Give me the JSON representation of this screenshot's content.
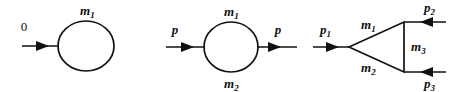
{
  "figure": {
    "name": "feynman-diagrams-one-loop",
    "background_color": "#ffffff",
    "ink_color": "#111111",
    "width": 457,
    "height": 92,
    "diagram_count": 3
  },
  "diagrams": [
    {
      "id": "tadpole",
      "name": "tadpole-diagram",
      "external_lines": [
        {
          "label": "0",
          "italic": false,
          "direction": "incoming",
          "position": "left"
        }
      ],
      "loop_labels": [
        {
          "label": "m",
          "subscript": "1",
          "position": "top"
        }
      ]
    },
    {
      "id": "self-energy",
      "name": "self-energy-bubble-diagram",
      "external_lines": [
        {
          "label": "p",
          "italic": true,
          "direction": "incoming",
          "position": "left"
        },
        {
          "label": "p",
          "italic": true,
          "direction": "outgoing",
          "position": "right"
        }
      ],
      "loop_labels": [
        {
          "label": "m",
          "subscript": "1",
          "position": "top"
        },
        {
          "label": "m",
          "subscript": "2",
          "position": "bottom"
        }
      ]
    },
    {
      "id": "triangle-vertex",
      "name": "triangle-vertex-diagram",
      "external_lines": [
        {
          "label": "p",
          "subscript": "1",
          "italic": true,
          "direction": "incoming",
          "position": "left"
        },
        {
          "label": "p",
          "subscript": "2",
          "italic": true,
          "direction": "incoming",
          "position": "top-right"
        },
        {
          "label": "p",
          "subscript": "3",
          "italic": true,
          "direction": "incoming",
          "position": "bottom-right"
        }
      ],
      "internal_labels": [
        {
          "label": "m",
          "subscript": "1",
          "position": "upper-left-edge"
        },
        {
          "label": "m",
          "subscript": "2",
          "position": "lower-left-edge"
        },
        {
          "label": "m",
          "subscript": "3",
          "position": "right-edge"
        }
      ]
    }
  ],
  "labels": {
    "d1_zero": "0",
    "d1_m1_base": "m",
    "d1_m1_sub": "1",
    "d2_p_in": "p",
    "d2_p_out": "p",
    "d2_m1_base": "m",
    "d2_m1_sub": "1",
    "d2_m2_base": "m",
    "d2_m2_sub": "2",
    "d3_p1_base": "p",
    "d3_p1_sub": "1",
    "d3_p2_base": "p",
    "d3_p2_sub": "2",
    "d3_p3_base": "p",
    "d3_p3_sub": "3",
    "d3_m1_base": "m",
    "d3_m1_sub": "1",
    "d3_m2_base": "m",
    "d3_m2_sub": "2",
    "d3_m3_base": "m",
    "d3_m3_sub": "3"
  }
}
